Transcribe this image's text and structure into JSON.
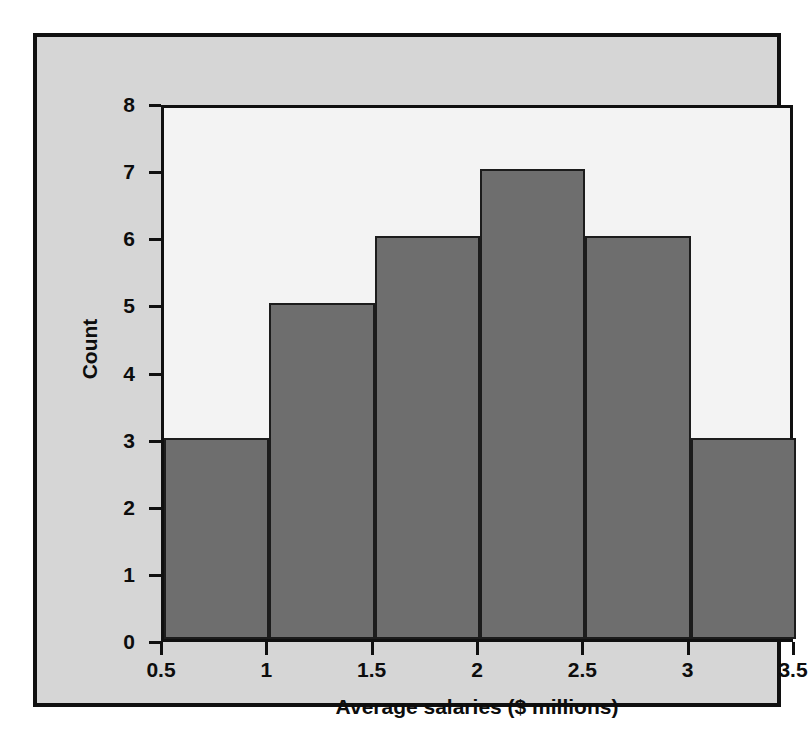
{
  "chart_data": {
    "type": "bar",
    "title": "",
    "xlabel": "Average salaries ($ millions)",
    "ylabel": "Count",
    "categories": [
      "0.5-1",
      "1-1.5",
      "1.5-2",
      "2-2.5",
      "2.5-3",
      "3-3.5"
    ],
    "bin_edges": [
      0.5,
      1,
      1.5,
      2,
      2.5,
      3,
      3.5
    ],
    "values": [
      3,
      5,
      6,
      7,
      6,
      3
    ],
    "xlim": [
      0.5,
      3.5
    ],
    "ylim": [
      0,
      8
    ],
    "xticks": [
      "0.5",
      "1",
      "1.5",
      "2",
      "2.5",
      "3",
      "3.5"
    ],
    "xtick_values": [
      0.5,
      1,
      1.5,
      2,
      2.5,
      3,
      3.5
    ],
    "yticks": [
      "0",
      "1",
      "2",
      "3",
      "4",
      "5",
      "6",
      "7",
      "8"
    ],
    "ytick_values": [
      0,
      1,
      2,
      3,
      4,
      5,
      6,
      7,
      8
    ],
    "grid": false,
    "legend": null,
    "bar_color": "#6e6e6e",
    "bar_edge_color": "#1c1c1c",
    "plot_background": "#f3f3f3",
    "figure_background": "#d6d6d6",
    "frame_color": "#101010"
  }
}
